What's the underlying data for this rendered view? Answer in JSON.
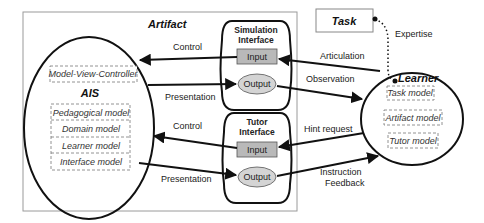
{
  "artifact": {
    "title": "Artifact",
    "ais": {
      "title": "AIS",
      "mvc": "Model-View-Controller",
      "models": [
        "Pedagogical model",
        "Domain model",
        "Learner model",
        "Interface model"
      ]
    },
    "simulation_interface": {
      "title_line1": "Simulation",
      "title_line2": "Interface",
      "input": "Input",
      "output": "Output"
    },
    "tutor_interface": {
      "title_line1": "Tutor",
      "title_line2": "Interface",
      "input": "Input",
      "output": "Output"
    },
    "edges": {
      "control_top": "Control",
      "presentation_top": "Presentation",
      "control_bottom": "Control",
      "presentation_bottom": "Presentation"
    }
  },
  "task": {
    "label": "Task"
  },
  "learner": {
    "title": "Learner",
    "models": [
      "Task model",
      "Artifact model",
      "Tutor model"
    ]
  },
  "edges": {
    "expertise": "Expertise",
    "articulation": "Articulation",
    "observation": "Observation",
    "hint_request": "Hint request",
    "instruction_line1": "Instruction",
    "instruction_line2": "Feedback"
  },
  "colors": {
    "input_fill": "#b9b9b9",
    "output_fill": "#d4d4d4",
    "frame_stroke": "#9a9a9a",
    "line": "#111111"
  }
}
